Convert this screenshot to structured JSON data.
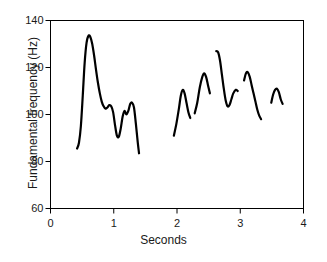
{
  "chart_data": {
    "type": "line",
    "title": "",
    "xlabel": "Seconds",
    "ylabel": "Fundamental frequency (Hz)",
    "xlim": [
      0,
      4
    ],
    "ylim": [
      60,
      140
    ],
    "xticks": [
      0,
      1,
      2,
      3,
      4
    ],
    "xtick_labels": [
      "0",
      "1",
      "2",
      "3",
      "4"
    ],
    "yticks": [
      60,
      80,
      100,
      120,
      140
    ],
    "ytick_labels": [
      "60",
      "80",
      "100",
      "120",
      "140"
    ],
    "grid": false,
    "legend": null,
    "line_color": "#000000",
    "line_width": 2.2,
    "series": [
      {
        "name": "Fundamental frequency contour",
        "description": "Pitch track broken into voiced segments",
        "segments": [
          {
            "id": "segment-1",
            "x": [
              0.42,
              0.45,
              0.48,
              0.51,
              0.54,
              0.57,
              0.6,
              0.63,
              0.66,
              0.69,
              0.72,
              0.75,
              0.78,
              0.81,
              0.84,
              0.87,
              0.9,
              0.93,
              0.96,
              0.99,
              1.02,
              1.05,
              1.08,
              1.11,
              1.14,
              1.17,
              1.2,
              1.23,
              1.26,
              1.29,
              1.32,
              1.35,
              1.38,
              1.4
            ],
            "y": [
              85.5,
              88.0,
              95.0,
              108.0,
              122.0,
              130.5,
              133.5,
              133.0,
              130.0,
              125.0,
              119.0,
              113.5,
              109.0,
              105.5,
              103.5,
              102.5,
              103.0,
              104.0,
              103.5,
              101.0,
              95.5,
              91.0,
              90.5,
              94.0,
              99.0,
              101.5,
              100.0,
              101.5,
              104.5,
              105.0,
              103.0,
              96.0,
              88.0,
              83.5
            ]
          },
          {
            "id": "segment-2",
            "x": [
              1.95,
              1.99,
              2.03,
              2.06,
              2.09,
              2.12,
              2.15,
              2.18,
              2.21
            ],
            "y": [
              91.0,
              96.0,
              102.5,
              108.0,
              110.5,
              109.0,
              105.0,
              101.0,
              98.5
            ]
          },
          {
            "id": "segment-3",
            "x": [
              2.28,
              2.32,
              2.36,
              2.4,
              2.43,
              2.46,
              2.49,
              2.52
            ],
            "y": [
              100.5,
              105.0,
              111.5,
              116.0,
              117.5,
              116.0,
              112.5,
              109.0
            ]
          },
          {
            "id": "segment-4",
            "x": [
              2.62,
              2.65,
              2.68,
              2.71,
              2.74,
              2.77,
              2.8,
              2.83,
              2.86,
              2.89,
              2.93,
              2.96
            ],
            "y": [
              127.0,
              126.5,
              123.0,
              117.0,
              111.0,
              106.0,
              103.5,
              104.0,
              106.5,
              109.0,
              110.5,
              110.0
            ]
          },
          {
            "id": "segment-5",
            "x": [
              3.06,
              3.09,
              3.12,
              3.15,
              3.18,
              3.21,
              3.24,
              3.27,
              3.3,
              3.33
            ],
            "y": [
              114.5,
              117.5,
              118.0,
              116.0,
              112.5,
              109.0,
              105.5,
              102.0,
              99.5,
              98.0
            ]
          },
          {
            "id": "segment-6",
            "x": [
              3.49,
              3.52,
              3.55,
              3.58,
              3.61,
              3.64,
              3.67
            ],
            "y": [
              105.0,
              108.5,
              110.5,
              111.0,
              109.5,
              106.5,
              104.5
            ]
          }
        ]
      }
    ]
  }
}
